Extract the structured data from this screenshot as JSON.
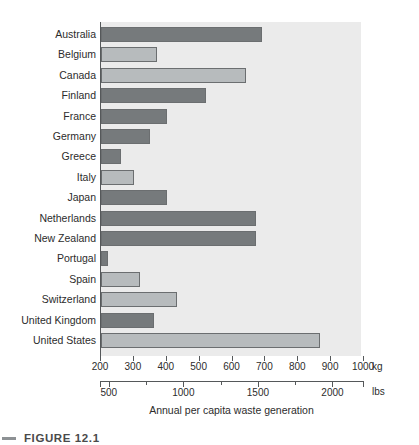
{
  "chart_data": {
    "type": "bar",
    "orientation": "horizontal",
    "title": "",
    "xlabel": "Annual per capita waste generation",
    "ylabel": "",
    "unit_primary": "kg",
    "unit_secondary": "lbs",
    "xlim": [
      200,
      1000
    ],
    "xlim_secondary": [
      441,
      2205
    ],
    "grid": false,
    "legend": null,
    "categories": [
      "Australia",
      "Belgium",
      "Canada",
      "Finland",
      "France",
      "Germany",
      "Greece",
      "Italy",
      "Japan",
      "Netherlands",
      "New Zealand",
      "Portugal",
      "Spain",
      "Switzerland",
      "United Kingdom",
      "United States"
    ],
    "values": [
      690,
      370,
      640,
      520,
      400,
      350,
      260,
      300,
      400,
      670,
      670,
      220,
      320,
      430,
      360,
      865
    ],
    "shades": [
      "dark",
      "light",
      "light",
      "dark",
      "dark",
      "dark",
      "dark",
      "light",
      "dark",
      "dark",
      "dark",
      "dark",
      "light",
      "light",
      "dark",
      "light"
    ],
    "x_ticks_kg": [
      200,
      300,
      400,
      500,
      600,
      700,
      800,
      900,
      1000
    ],
    "x_tick_labels_kg": [
      "200",
      "300",
      "400",
      "500",
      "600",
      "700",
      "800",
      "900",
      "1000"
    ],
    "x_ticks_lbs": [
      500,
      1000,
      1500,
      2000
    ],
    "x_tick_labels_lbs": [
      "500",
      "1000",
      "1500",
      "2000"
    ],
    "x_minor_ticks_lbs": [
      750,
      1250,
      1750
    ]
  },
  "axes": {
    "kg_unit_label": "kg",
    "lbs_unit_label": "lbs",
    "x_axis_title": "Annual per capita waste generation"
  },
  "caption": {
    "text": "FIGURE 12.1"
  },
  "colors": {
    "plot_background": "#ebebeb",
    "bar_dark": "#767a7c",
    "bar_light": "#b7bbbd",
    "bar_border": "#6b6e70",
    "axis": "#55585a",
    "text": "#2c2c2c",
    "page_background": "#ffffff"
  }
}
